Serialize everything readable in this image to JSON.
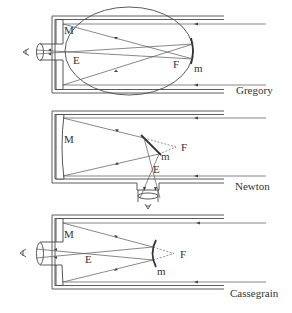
{
  "diagrams": [
    {
      "name": "Gregory",
      "labels": {
        "primary_mirror": "M",
        "eyepiece": "E",
        "focus": "F",
        "secondary_mirror": "m"
      }
    },
    {
      "name": "Newton",
      "labels": {
        "primary_mirror": "M",
        "eyepiece": "E",
        "focus": "F",
        "secondary_mirror": "m"
      }
    },
    {
      "name": "Cassegrain",
      "labels": {
        "primary_mirror": "M",
        "eyepiece": "E",
        "focus": "F",
        "secondary_mirror": "m"
      }
    }
  ],
  "colors": {
    "line": "#4a4a4a",
    "text": "#333333",
    "background": "#ffffff"
  }
}
